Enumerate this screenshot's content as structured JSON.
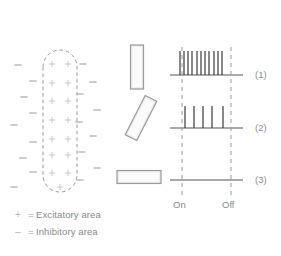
{
  "figure": {
    "background_color": "#ffffff"
  },
  "receptive_field": {
    "name": "receptive-field-map",
    "outline": {
      "shape": "rounded-vertical-oval",
      "style": "dashed",
      "color": "#9a9a9a",
      "cx": 60,
      "cy": 120,
      "half_width": 17,
      "top": 50,
      "bottom": 192
    },
    "excitatory_symbol": "+",
    "inhibitory_symbol": "–",
    "excitatory_color": "#cfcfcf",
    "inhibitory_color": "#b0b0b0",
    "excitatory_points": [
      {
        "x": 52,
        "y": 64
      },
      {
        "x": 68,
        "y": 64
      },
      {
        "x": 52,
        "y": 83
      },
      {
        "x": 68,
        "y": 83
      },
      {
        "x": 52,
        "y": 101
      },
      {
        "x": 68,
        "y": 101
      },
      {
        "x": 52,
        "y": 120
      },
      {
        "x": 68,
        "y": 120
      },
      {
        "x": 52,
        "y": 139
      },
      {
        "x": 68,
        "y": 139
      },
      {
        "x": 52,
        "y": 155
      },
      {
        "x": 68,
        "y": 155
      },
      {
        "x": 52,
        "y": 173
      },
      {
        "x": 68,
        "y": 173
      },
      {
        "x": 60,
        "y": 187
      }
    ],
    "inhibitory_points": [
      {
        "x": 18,
        "y": 65
      },
      {
        "x": 33,
        "y": 81
      },
      {
        "x": 24,
        "y": 97
      },
      {
        "x": 33,
        "y": 113
      },
      {
        "x": 14,
        "y": 125
      },
      {
        "x": 33,
        "y": 142
      },
      {
        "x": 23,
        "y": 158
      },
      {
        "x": 33,
        "y": 172
      },
      {
        "x": 14,
        "y": 187
      },
      {
        "x": 83,
        "y": 64
      },
      {
        "x": 93,
        "y": 82
      },
      {
        "x": 80,
        "y": 94
      },
      {
        "x": 97,
        "y": 110
      },
      {
        "x": 79,
        "y": 122
      },
      {
        "x": 93,
        "y": 136
      },
      {
        "x": 82,
        "y": 152
      },
      {
        "x": 97,
        "y": 168
      },
      {
        "x": 80,
        "y": 180
      }
    ]
  },
  "stimuli": [
    {
      "id": "stimulus-bar-vertical",
      "label": "vertical bar",
      "cx": 137,
      "cy": 67,
      "width": 13,
      "height": 44,
      "angle": 0,
      "fill": "#eeeeee",
      "stroke": "#9a9a9a"
    },
    {
      "id": "stimulus-bar-oblique",
      "label": "oblique bar",
      "cx": 141,
      "cy": 118,
      "width": 13,
      "height": 44,
      "angle": 27,
      "fill": "#eeeeee",
      "stroke": "#9a9a9a"
    },
    {
      "id": "stimulus-bar-horizontal",
      "label": "horizontal bar",
      "cx": 139,
      "cy": 177,
      "width": 13,
      "height": 44,
      "angle": 90,
      "fill": "#eeeeee",
      "stroke": "#9a9a9a"
    }
  ],
  "recording": {
    "baseline_color": "#8c8c8c",
    "spike_color": "#3a3a3a",
    "marker_color": "#9a9a9a",
    "axis_left": 170,
    "axis_right": 243,
    "on_x": 182,
    "off_x": 231,
    "markers": [
      {
        "name": "on",
        "label": "On",
        "x": 182
      },
      {
        "name": "off",
        "label": "Off",
        "x": 231
      }
    ],
    "traces": [
      {
        "name": "trace-1",
        "label": "(1)",
        "baseline_y": 75,
        "spike_height": 24,
        "spike_count": 11,
        "spike_x": [
          180,
          184,
          188,
          192,
          197,
          201,
          205,
          209,
          214,
          218,
          222
        ],
        "label_x": 255,
        "label_y": 75
      },
      {
        "name": "trace-2",
        "label": "(2)",
        "baseline_y": 128,
        "spike_height": 22,
        "spike_count": 5,
        "spike_x": [
          185,
          194,
          203,
          212,
          223
        ],
        "label_x": 255,
        "label_y": 128
      },
      {
        "name": "trace-3",
        "label": "(3)",
        "baseline_y": 180,
        "spike_height": 0,
        "spike_count": 0,
        "spike_x": [],
        "label_x": 255,
        "label_y": 180
      }
    ]
  },
  "legend": {
    "rows": [
      {
        "symbol": "+",
        "equals": "=",
        "text": "Excitatory area"
      },
      {
        "symbol": "–",
        "equals": "=",
        "text": "Inhibitory area"
      }
    ]
  },
  "chart_data": {
    "type": "scatter",
    "xlabel": "",
    "ylabel": "",
    "series": [
      {
        "name": "Trace (1) vertical bar",
        "spike_count": 11
      },
      {
        "name": "Trace (2) oblique bar",
        "spike_count": 5
      },
      {
        "name": "Trace (3) horizontal bar",
        "spike_count": 0
      }
    ],
    "annotations": [
      "On",
      "Off",
      "(1)",
      "(2)",
      "(3)"
    ]
  }
}
